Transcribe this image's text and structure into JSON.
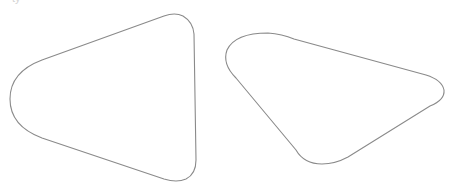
{
  "canvas": {
    "width": 458,
    "height": 189,
    "background": "#ffffff"
  },
  "top_fragment": {
    "text": "ty",
    "color": "#d4d4d4"
  },
  "shapes": [
    {
      "name": "rounded-triangle-left",
      "stroke": "#8a8a8a",
      "path": "M 42 60 L 164 16 Q 175 12 183 16 Q 193 22 194 34 L 196 160 Q 196 174 186 179 Q 177 183 164 179 L 42 138 Q 10 126 10 99 Q 10 72 42 60 Z"
    },
    {
      "name": "rounded-triangle-right",
      "stroke": "#8a8a8a",
      "path": "M 236 78 Q 222 64 227 50 Q 235 33 268 33 Q 282 34 294 39 L 426 75 Q 442 80 444 90 Q 445 100 430 106 L 348 157 Q 335 164 322 164 Q 304 164 296 150 Z"
    }
  ]
}
